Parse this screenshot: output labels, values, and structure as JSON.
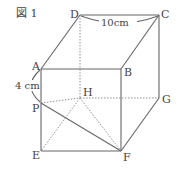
{
  "figure": {
    "title": "図 1",
    "dimension_top": "10cm",
    "dimension_side": "4 cm"
  },
  "vertices": {
    "A": "A",
    "B": "B",
    "C": "C",
    "D": "D",
    "E": "E",
    "F": "F",
    "G": "G",
    "H": "H",
    "P": "P"
  },
  "colors": {
    "line": "#666666",
    "hidden_line": "#888888",
    "text": "#444444"
  }
}
